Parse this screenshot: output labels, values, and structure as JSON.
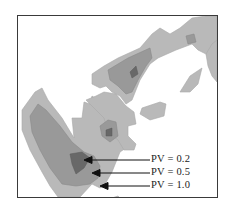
{
  "figure": {
    "type": "contour-map",
    "colors": {
      "outer": "#b9b9b9",
      "middle": "#999999",
      "inner": "#686868",
      "frame": "#3a3a3a",
      "arrow": "#111111"
    },
    "annotations": [
      {
        "id": "pv-0-2",
        "label": "PV = 0.2"
      },
      {
        "id": "pv-0-5",
        "label": "PV = 0.5"
      },
      {
        "id": "pv-1-0",
        "label": "PV = 1.0"
      }
    ]
  }
}
